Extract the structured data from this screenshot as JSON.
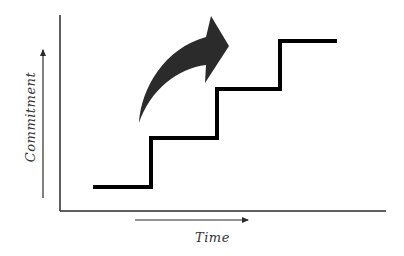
{
  "diagram": {
    "title": "",
    "x_axis_label": "Time",
    "y_axis_label": "Commitment",
    "colors": {
      "background": "#ffffff",
      "axis": "#2a2a2a",
      "staircase": "#000000",
      "arrow": "#2b2b2b",
      "label": "#333333"
    },
    "staircase_steps": [
      {
        "level": 1,
        "label": ""
      },
      {
        "level": 2,
        "label": ""
      },
      {
        "level": 3,
        "label": ""
      },
      {
        "level": 4,
        "label": ""
      }
    ],
    "icons": {
      "curved_arrow": "curved-up-right-arrow-icon",
      "x_direction_arrow": "right-arrow-icon",
      "y_direction_arrow": "up-arrow-icon"
    }
  }
}
